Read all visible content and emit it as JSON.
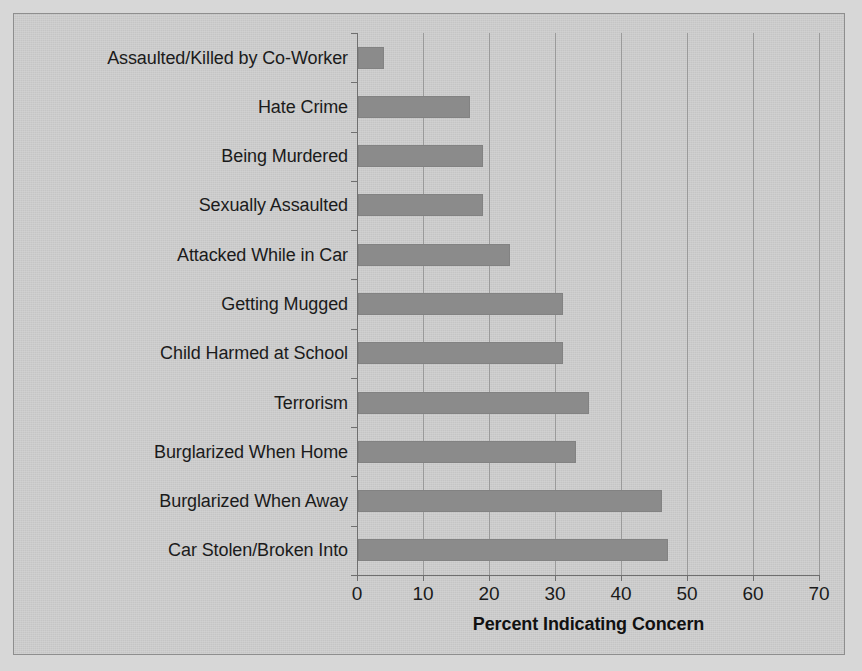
{
  "chart_data": {
    "type": "bar",
    "orientation": "horizontal",
    "title": "",
    "xlabel": "Percent Indicating Concern",
    "ylabel": "",
    "xlim": [
      0,
      70
    ],
    "xticks": [
      0,
      10,
      20,
      30,
      40,
      50,
      60,
      70
    ],
    "xtick_labels": [
      "0",
      "10",
      "20",
      "30",
      "40",
      "50",
      "60",
      "70"
    ],
    "grid": "vertical",
    "legend": "none",
    "bar_color": "#8b8b8b",
    "categories": [
      "Assaulted/Killed by Co-Worker",
      "Hate Crime",
      "Being Murdered",
      "Sexually Assaulted",
      "Attacked While in Car",
      "Getting Mugged",
      "Child Harmed at School",
      "Terrorism",
      "Burglarized When Home",
      "Burglarized When Away",
      "Car Stolen/Broken Into"
    ],
    "values": [
      4,
      17,
      19,
      19,
      23,
      31,
      31,
      35,
      33,
      46,
      47
    ]
  },
  "figure": {
    "background_color": "#d7d7d7",
    "panel_color": "#c9c9c9",
    "panel_border_color": "#8e8e8e",
    "axis_color": "#6f6f6f",
    "gridline_color": "#9a9a9a",
    "text_color": "#1b1b1b"
  }
}
